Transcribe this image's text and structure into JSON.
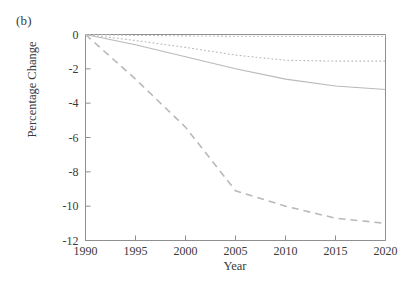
{
  "figure": {
    "panel_label": "(b)",
    "xlabel": "Year",
    "ylabel": "Percentage Change"
  },
  "chart_data": {
    "type": "line",
    "title": "",
    "panel": "(b)",
    "xlabel": "Year",
    "ylabel": "Percentage Change",
    "xlim": [
      1990,
      2020
    ],
    "ylim": [
      -12,
      0
    ],
    "xticks": [
      1990,
      1995,
      2000,
      2005,
      2010,
      2015,
      2020
    ],
    "xticklabels": [
      "1990",
      "1995",
      "2000",
      "2005",
      "2010",
      "2015",
      "2020"
    ],
    "yticks": [
      0,
      -2,
      -4,
      -6,
      -8,
      -10,
      -12
    ],
    "yticklabels": [
      "0",
      "-2",
      "-4",
      "-6",
      "-8",
      "-10",
      "-12"
    ],
    "grid": false,
    "legend": "none",
    "line_color": "#b9b9b9",
    "axis_color": "#8f8f8f",
    "x": [
      1990,
      1995,
      2000,
      2005,
      2010,
      2015,
      2020
    ],
    "series": [
      {
        "name": "series-1",
        "style": "dotted",
        "values": [
          0.0,
          -0.05,
          -0.08,
          -0.1,
          -0.1,
          -0.1,
          -0.1
        ]
      },
      {
        "name": "series-2",
        "style": "dotted",
        "values": [
          0.0,
          -0.35,
          -0.75,
          -1.2,
          -1.5,
          -1.55,
          -1.55
        ]
      },
      {
        "name": "series-3",
        "style": "solid",
        "values": [
          0.0,
          -0.6,
          -1.3,
          -2.0,
          -2.6,
          -3.0,
          -3.2
        ]
      },
      {
        "name": "series-4",
        "style": "dashed",
        "values": [
          0.0,
          -2.6,
          -5.4,
          -9.1,
          -10.0,
          -10.7,
          -11.0
        ]
      }
    ]
  }
}
